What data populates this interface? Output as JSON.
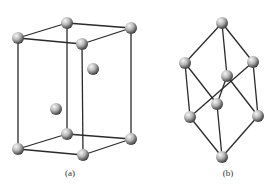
{
  "figure": {
    "colors": {
      "background": "#ffffff",
      "edge": "#2a2a2a",
      "atom_light": "#f4f4f4",
      "atom_dark": "#2e2e2e"
    },
    "panels": [
      {
        "id": "a",
        "label": "(a)",
        "label_pos": [
          70,
          176
        ],
        "atoms": [
          {
            "name": "top-back-left",
            "x": 67,
            "y": 23
          },
          {
            "name": "top-back-right",
            "x": 131,
            "y": 28
          },
          {
            "name": "top-front-left",
            "x": 18,
            "y": 38
          },
          {
            "name": "top-front-right",
            "x": 82,
            "y": 44
          },
          {
            "name": "inner-upper",
            "x": 93,
            "y": 69
          },
          {
            "name": "inner-lower",
            "x": 56,
            "y": 109
          },
          {
            "name": "bottom-back-left",
            "x": 67,
            "y": 134
          },
          {
            "name": "bottom-back-right",
            "x": 131,
            "y": 139
          },
          {
            "name": "bottom-front-left",
            "x": 18,
            "y": 149
          },
          {
            "name": "bottom-front-right",
            "x": 83,
            "y": 155
          }
        ],
        "edges": [
          [
            2,
            0
          ],
          [
            0,
            1
          ],
          [
            1,
            3
          ],
          [
            3,
            2
          ],
          [
            8,
            6
          ],
          [
            6,
            7
          ],
          [
            7,
            9
          ],
          [
            9,
            8
          ],
          [
            2,
            8
          ],
          [
            0,
            6
          ],
          [
            1,
            7
          ],
          [
            3,
            9
          ]
        ]
      },
      {
        "id": "b",
        "label": "(b)",
        "label_pos": [
          228,
          176
        ],
        "atoms": [
          {
            "name": "top",
            "x": 222,
            "y": 23
          },
          {
            "name": "upper-left",
            "x": 185,
            "y": 63
          },
          {
            "name": "upper-right",
            "x": 253,
            "y": 62
          },
          {
            "name": "middle-back",
            "x": 227,
            "y": 76
          },
          {
            "name": "middle-front",
            "x": 217,
            "y": 104
          },
          {
            "name": "lower-left",
            "x": 190,
            "y": 117
          },
          {
            "name": "lower-right",
            "x": 258,
            "y": 116
          },
          {
            "name": "bottom",
            "x": 222,
            "y": 157
          }
        ],
        "edges": [
          [
            0,
            1
          ],
          [
            0,
            2
          ],
          [
            0,
            3
          ],
          [
            1,
            4
          ],
          [
            1,
            5
          ],
          [
            2,
            5
          ],
          [
            2,
            6
          ],
          [
            3,
            4
          ],
          [
            3,
            6
          ],
          [
            4,
            7
          ],
          [
            5,
            7
          ],
          [
            6,
            7
          ]
        ]
      }
    ]
  }
}
